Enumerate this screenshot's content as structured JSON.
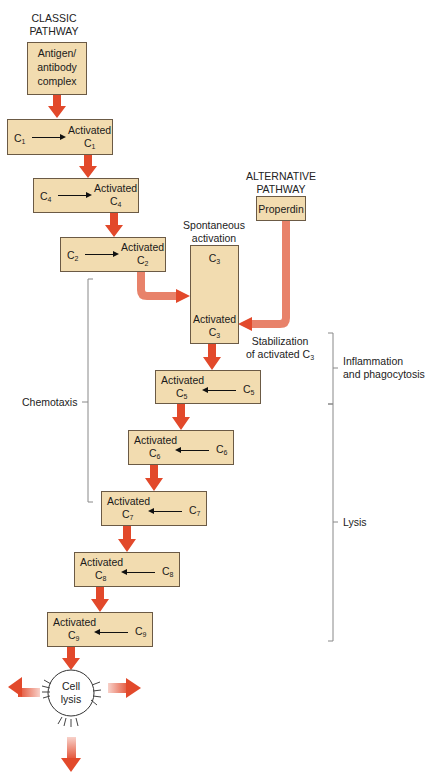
{
  "pathways": {
    "classic": {
      "label_line1": "CLASSIC",
      "label_line2": "PATHWAY",
      "trigger_line1": "Antigen/",
      "trigger_line2": "antibody",
      "trigger_line3": "complex"
    },
    "alternative": {
      "label_line1": "ALTERNATIVE",
      "label_line2": "PATHWAY",
      "trigger": "Properdin"
    }
  },
  "colors": {
    "box_fill": "#f2dcb0",
    "box_border": "#6b5a45",
    "arrow": "#e2492b",
    "arrow_light": "#e8826a",
    "bracket": "#777777"
  },
  "steps": [
    {
      "id": "c1",
      "input": "C",
      "input_sub": "1",
      "output": "Activated",
      "output_c": "C",
      "output_sub": "1"
    },
    {
      "id": "c4",
      "input": "C",
      "input_sub": "4",
      "output": "Activated",
      "output_c": "C",
      "output_sub": "4"
    },
    {
      "id": "c2",
      "input": "C",
      "input_sub": "2",
      "output": "Activated",
      "output_c": "C",
      "output_sub": "2"
    },
    {
      "id": "c3",
      "input": "C",
      "input_sub": "3",
      "output": "Activated",
      "output_c": "C",
      "output_sub": "3"
    },
    {
      "id": "c5",
      "input": "C",
      "input_sub": "5",
      "output": "Activated",
      "output_c": "C",
      "output_sub": "5"
    },
    {
      "id": "c6",
      "input": "C",
      "input_sub": "6",
      "output": "Activated",
      "output_c": "C",
      "output_sub": "6"
    },
    {
      "id": "c7",
      "input": "C",
      "input_sub": "7",
      "output": "Activated",
      "output_c": "C",
      "output_sub": "7"
    },
    {
      "id": "c8",
      "input": "C",
      "input_sub": "8",
      "output": "Activated",
      "output_c": "C",
      "output_sub": "8"
    },
    {
      "id": "c9",
      "input": "C",
      "input_sub": "9",
      "output": "Activated",
      "output_c": "C",
      "output_sub": "9"
    }
  ],
  "annotations": {
    "spontaneous_line1": "Spontaneous",
    "spontaneous_line2": "activation",
    "stabilization_line1": "Stabilization",
    "stabilization_line2": "of activated C",
    "stabilization_sub": "3",
    "chemotaxis": "Chemotaxis",
    "inflammation_line1": "Inflammation",
    "inflammation_line2": "and phagocytosis",
    "lysis": "Lysis",
    "cell_lysis_line1": "Cell",
    "cell_lysis_line2": "lysis"
  }
}
